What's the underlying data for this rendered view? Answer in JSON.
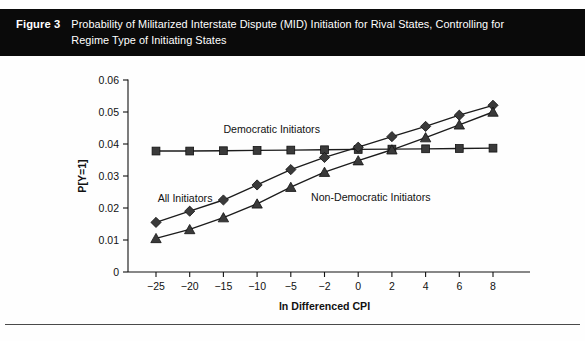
{
  "figure": {
    "label": "Figure 3",
    "caption": "Probability of Militarized Interstate Dispute (MID) Initiation for Rival States, Controlling for Regime Type of Initiating States",
    "band_color": "#0a0a0a",
    "text_color": "#ffffff"
  },
  "chart_data": {
    "type": "line",
    "title": "",
    "xlabel": "ln Differenced CPI",
    "ylabel": "P[Y=1]",
    "categories": [
      "−25",
      "−20",
      "−15",
      "−10",
      "−5",
      "−2",
      "0",
      "2",
      "4",
      "6",
      "8"
    ],
    "ylim": [
      0,
      0.06
    ],
    "yticks": [
      "0",
      "0.01",
      "0.02",
      "0.03",
      "0.04",
      "0.05",
      "0.06"
    ],
    "ytick_values": [
      0,
      0.01,
      0.02,
      0.03,
      0.04,
      0.05,
      0.06
    ],
    "grid": false,
    "legend": "inline-annotations",
    "series": [
      {
        "name": "Democratic Initiators",
        "marker": "square",
        "values": [
          0.0378,
          0.0378,
          0.0379,
          0.038,
          0.0381,
          0.0382,
          0.0383,
          0.0384,
          0.0385,
          0.0386,
          0.0387
        ]
      },
      {
        "name": "All Initiators",
        "marker": "diamond",
        "values": [
          0.0155,
          0.019,
          0.0225,
          0.0272,
          0.032,
          0.0358,
          0.039,
          0.0423,
          0.0455,
          0.049,
          0.0521
        ]
      },
      {
        "name": "Non-Democratic Initiators",
        "marker": "triangle",
        "values": [
          0.0105,
          0.0133,
          0.017,
          0.0213,
          0.0265,
          0.0312,
          0.0348,
          0.0382,
          0.042,
          0.046,
          0.05
        ]
      }
    ],
    "annotations": [
      {
        "text": "Democratic Initiators",
        "x_index": 2.0,
        "y": 0.0435,
        "anchor": "start"
      },
      {
        "text": "All Initiators",
        "x_index": 0.05,
        "y": 0.0218,
        "anchor": "start"
      },
      {
        "text": "Non-Democratic Initiators",
        "x_index": 4.6,
        "y": 0.0222,
        "anchor": "start"
      }
    ]
  }
}
